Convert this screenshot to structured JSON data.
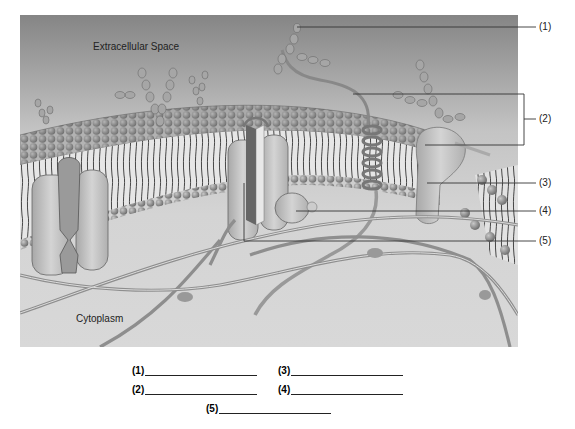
{
  "figure": {
    "regions": {
      "extracellular": "Extracellular Space",
      "cytoplasm": "Cytoplasm"
    },
    "callouts": [
      {
        "id": 1,
        "label": "(1)",
        "target": "glycolipid/glycoprotein carbohydrate chain"
      },
      {
        "id": 2,
        "label": "(2)",
        "target": "glycoprotein / glycolipid pair (bracket)"
      },
      {
        "id": 3,
        "label": "(3)",
        "target": "phospholipid bilayer / cholesterol"
      },
      {
        "id": 4,
        "label": "(4)",
        "target": "peripheral protein"
      },
      {
        "id": 5,
        "label": "(5)",
        "target": "integral (channel) protein"
      }
    ],
    "colors": {
      "background_top": "#8a8a8a",
      "background_bottom": "#d0d0d0",
      "phosphate_head": "#8c8c8c",
      "protein": "#bdbdbd",
      "leader_line": "#333333"
    }
  },
  "answer_blanks": [
    {
      "label": "(1)"
    },
    {
      "label": "(2)"
    },
    {
      "label": "(3)"
    },
    {
      "label": "(4)"
    },
    {
      "label": "(5)"
    }
  ]
}
